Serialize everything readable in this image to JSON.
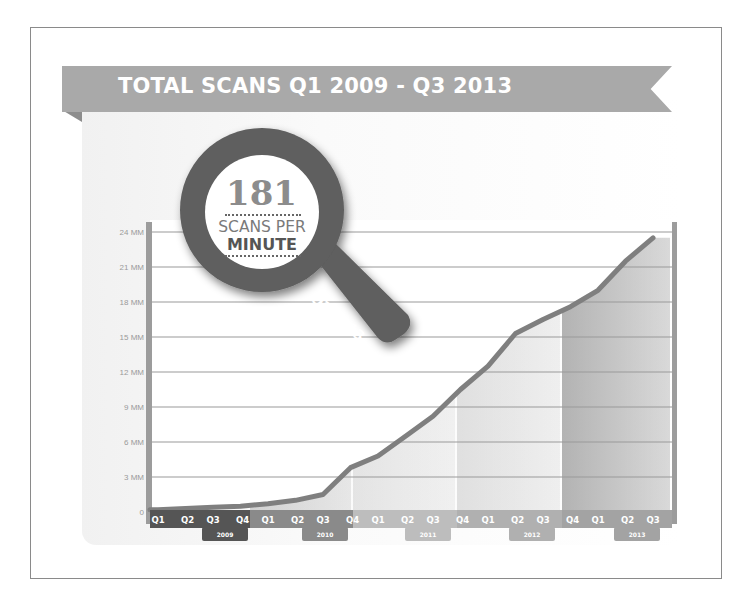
{
  "title": "TOTAL SCANS Q1 2009 - Q3 2013",
  "callout": {
    "number": "181",
    "line1": "SCANS PER",
    "line2": "MINUTE",
    "period": "Q3 2013"
  },
  "colors": {
    "ribbon": "#a9a9a9",
    "axis": "#9c9c9c",
    "line": "#7f7f7f",
    "magnifier": "#5e5e5e",
    "year_2009": "#555555",
    "year_2010": "#8a8a8a",
    "year_2011": "#c8c8c8",
    "year_2012": "#bdbdbd",
    "year_2013": "#9a9a9a"
  },
  "chart_data": {
    "type": "area",
    "title": "TOTAL SCANS Q1 2009 - Q3 2013",
    "xlabel": "",
    "ylabel": "",
    "ylim": [
      0,
      24
    ],
    "grid": true,
    "y_ticks": [
      "0",
      "3 MM",
      "6 MM",
      "9 MM",
      "12 MM",
      "15 MM",
      "18 MM",
      "21 MM",
      "24 MM"
    ],
    "categories": [
      "Q1",
      "Q2",
      "Q3",
      "Q4",
      "Q1",
      "Q2",
      "Q3",
      "Q4",
      "Q1",
      "Q2",
      "Q3",
      "Q4",
      "Q1",
      "Q2",
      "Q3",
      "Q4",
      "Q1",
      "Q2",
      "Q3"
    ],
    "years": [
      {
        "label": "2009",
        "start": 0,
        "count": 4
      },
      {
        "label": "2010",
        "start": 4,
        "count": 4
      },
      {
        "label": "2011",
        "start": 8,
        "count": 4
      },
      {
        "label": "2012",
        "start": 12,
        "count": 4
      },
      {
        "label": "2013",
        "start": 16,
        "count": 3
      }
    ],
    "series": [
      {
        "name": "Total scans (millions)",
        "values": [
          0.2,
          0.3,
          0.4,
          0.5,
          0.7,
          1.0,
          1.5,
          3.8,
          4.8,
          6.5,
          8.2,
          10.5,
          12.5,
          15.3,
          16.5,
          17.6,
          19.0,
          21.5,
          23.5
        ]
      }
    ],
    "annotations": [
      "181 SCANS PER MINUTE",
      "Q3 2013"
    ]
  }
}
